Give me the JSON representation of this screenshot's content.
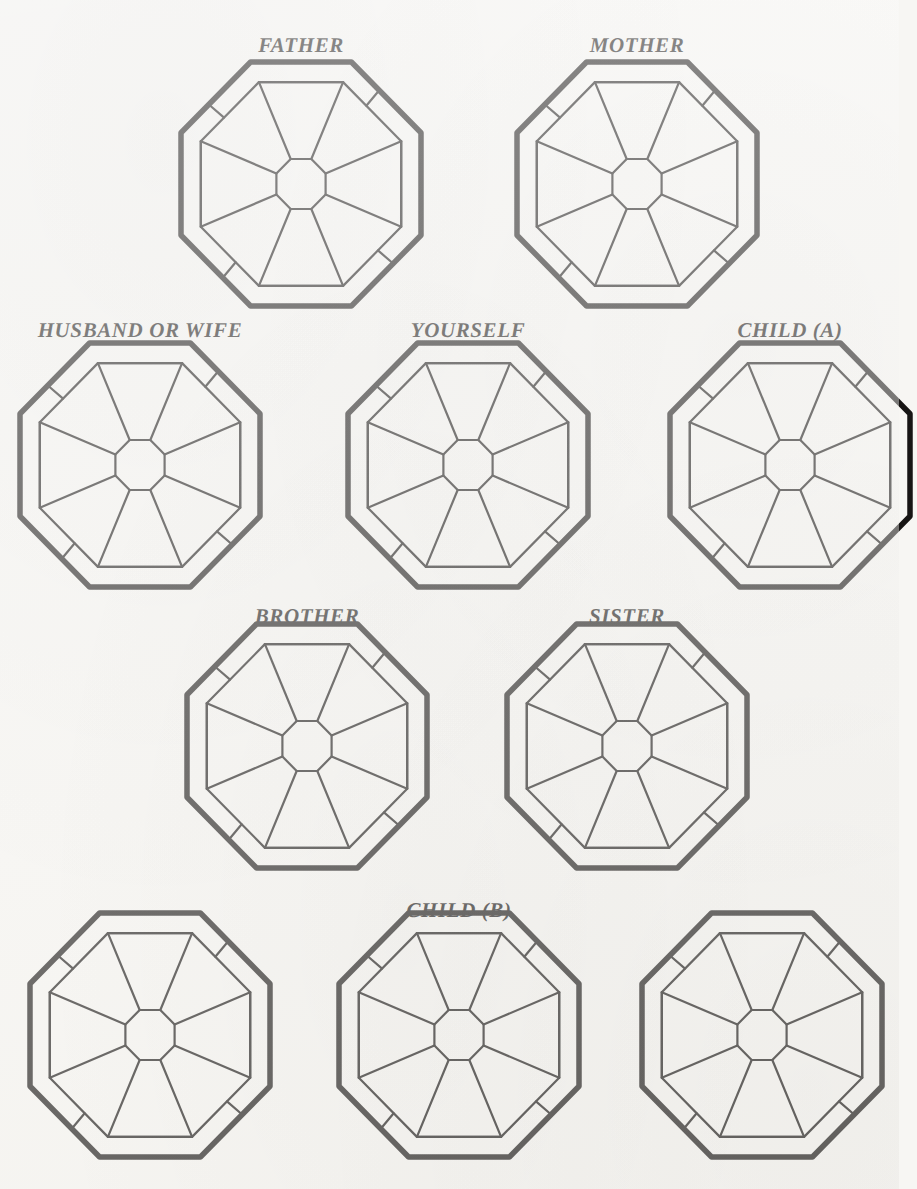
{
  "document": {
    "kind": "octagon-relationship-worksheet",
    "background_color": "#f7f6f3",
    "ink_color": "#171514",
    "figure_count": 10,
    "label_count": 7
  },
  "labels": {
    "father": "FATHER",
    "mother": "MOTHER",
    "husband_or_wife": "HUSBAND OR WIFE",
    "yourself": "YOURSELF",
    "child_a": "CHILD (A)",
    "brother": "BROTHER",
    "sister": "SISTER",
    "child_b": "CHILD (B)"
  },
  "rows": [
    {
      "row_index": 1,
      "figures": [
        {
          "id": "father",
          "label": "FATHER",
          "labeled": true,
          "cx": 301,
          "cy": 184,
          "rw": 120,
          "rh": 122,
          "label_x": 301,
          "label_y": 33
        },
        {
          "id": "mother",
          "label": "MOTHER",
          "labeled": true,
          "cx": 637,
          "cy": 184,
          "rw": 120,
          "rh": 122,
          "label_x": 637,
          "label_y": 33
        }
      ]
    },
    {
      "row_index": 2,
      "figures": [
        {
          "id": "husband-or-wife",
          "label": "HUSBAND OR WIFE",
          "labeled": true,
          "cx": 140,
          "cy": 465,
          "rw": 120,
          "rh": 122,
          "label_x": 140,
          "label_y": 318
        },
        {
          "id": "yourself",
          "label": "YOURSELF",
          "labeled": true,
          "cx": 468,
          "cy": 465,
          "rw": 120,
          "rh": 122,
          "label_x": 468,
          "label_y": 318
        },
        {
          "id": "child-a",
          "label": "CHILD (A)",
          "labeled": true,
          "cx": 790,
          "cy": 465,
          "rw": 120,
          "rh": 122,
          "label_x": 790,
          "label_y": 318
        }
      ]
    },
    {
      "row_index": 3,
      "figures": [
        {
          "id": "brother",
          "label": "BROTHER",
          "labeled": true,
          "cx": 307,
          "cy": 746,
          "rw": 120,
          "rh": 122,
          "label_x": 307,
          "label_y": 604
        },
        {
          "id": "sister",
          "label": "SISTER",
          "labeled": true,
          "cx": 627,
          "cy": 746,
          "rw": 120,
          "rh": 122,
          "label_x": 627,
          "label_y": 604
        }
      ]
    },
    {
      "row_index": 4,
      "figures": [
        {
          "id": "row4-left",
          "label": "",
          "labeled": false,
          "cx": 150,
          "cy": 1035,
          "rw": 120,
          "rh": 122,
          "label_x": 150,
          "label_y": 898
        },
        {
          "id": "child-b",
          "label": "CHILD (B)",
          "labeled": true,
          "cx": 459,
          "cy": 1035,
          "rw": 120,
          "rh": 122,
          "label_x": 459,
          "label_y": 898
        },
        {
          "id": "row4-right",
          "label": "",
          "labeled": false,
          "cx": 762,
          "cy": 1035,
          "rw": 120,
          "rh": 122,
          "label_x": 762,
          "label_y": 898
        }
      ]
    }
  ],
  "octagon_geometry": {
    "description": "Octagon with outer heavy outline, an inset ring band, a small central octagon, eight radial spokes, and four tick marks crossing the diagonal band segments.",
    "outer_stroke_width": 5.5,
    "inner_stroke_width": 2.2,
    "tick_stroke_width": 2.2,
    "band_inset_ratio": 0.165,
    "hub_radius_ratio": 0.205,
    "axis_vertices": 8,
    "spoke_count": 8,
    "tick_count": 4,
    "corner_cut_ratio": 0.42
  }
}
